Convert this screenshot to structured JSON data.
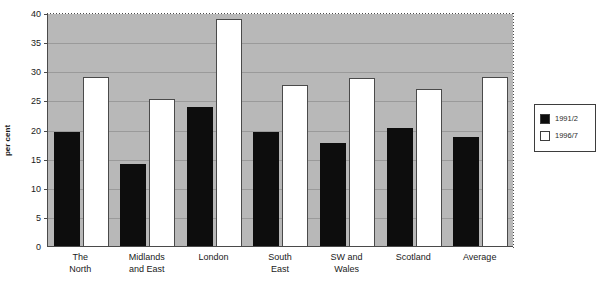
{
  "chart_data": {
    "type": "bar",
    "title": "",
    "xlabel": "",
    "ylabel": "per cent",
    "ylim": [
      0,
      40
    ],
    "yticks": [
      0,
      5,
      10,
      15,
      20,
      25,
      30,
      35,
      40
    ],
    "grid": true,
    "legend_position": "right-outside",
    "categories": [
      "The\nNorth",
      "Midlands\nand East",
      "London",
      "South\nEast",
      "SW and\nWales",
      "Scotland",
      "Average"
    ],
    "series": [
      {
        "name": "1991/2",
        "color": "#0d0d0d",
        "values": [
          19.6,
          14.0,
          23.8,
          19.5,
          17.6,
          20.3,
          18.8
        ]
      },
      {
        "name": "1996/7",
        "color": "#ffffff",
        "values": [
          29.0,
          25.2,
          39.0,
          27.7,
          28.8,
          27.0,
          29.0
        ]
      }
    ]
  },
  "style": {
    "plot_background": "#b8b8b8",
    "gridline_color": "#9a9a9a",
    "axis_color": "#4a4a4a",
    "text_color": "#1a1a1a"
  }
}
